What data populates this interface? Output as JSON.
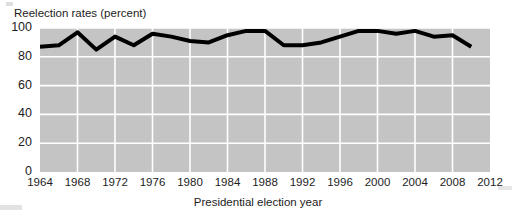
{
  "chart_data": {
    "type": "line",
    "title": "Reelection rates (percent)",
    "xlabel": "Presidential election year",
    "ylabel": "",
    "ylim": [
      0,
      100
    ],
    "yticks": [
      0,
      20,
      40,
      60,
      80,
      100
    ],
    "ytick_labels": [
      "0",
      "20",
      "40",
      "60",
      "80",
      "100"
    ],
    "xlim": [
      1964,
      2012
    ],
    "xticks": [
      1964,
      1968,
      1972,
      1976,
      1980,
      1984,
      1988,
      1992,
      1996,
      2000,
      2004,
      2008,
      2012
    ],
    "xtick_labels": [
      "1964",
      "1968",
      "1972",
      "1976",
      "1980",
      "1984",
      "1988",
      "1992",
      "1996",
      "2000",
      "2004",
      "2008",
      "2012"
    ],
    "grid": true,
    "legend": null,
    "x": [
      1964,
      1966,
      1968,
      1970,
      1972,
      1974,
      1976,
      1978,
      1980,
      1982,
      1984,
      1986,
      1988,
      1990,
      1992,
      1994,
      1996,
      1998,
      2000,
      2002,
      2004,
      2006,
      2008,
      2010
    ],
    "series": [
      {
        "name": "Reelection rate",
        "values": [
          87,
          88,
          97,
          85,
          94,
          88,
          96,
          94,
          91,
          90,
          95,
          98,
          98,
          88,
          88,
          90,
          94,
          98,
          98,
          96,
          98,
          94,
          95,
          87
        ]
      }
    ],
    "plot_bg_color": "#c4c4c4",
    "grid_color": "#ffffff",
    "line_color": "#000000",
    "line_width": 4
  },
  "chart": {
    "title": "Reelection rates (percent)",
    "x_axis_caption": "Presidential election year"
  }
}
